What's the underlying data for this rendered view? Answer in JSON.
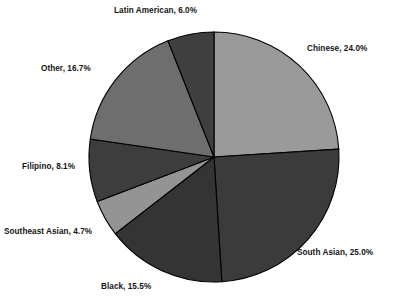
{
  "chart_data": {
    "type": "pie",
    "title": "",
    "subtitle": "",
    "xlabel": "",
    "ylabel": "",
    "legend_position": "none",
    "grid": false,
    "label_format": "{name}, {value}%",
    "start_angle_deg": 0,
    "direction": "clockwise",
    "center": {
      "cx": 214,
      "cy": 157,
      "r": 125
    },
    "categories": [
      "Chinese",
      "South Asian",
      "Black",
      "Southeast Asian",
      "Filipino",
      "Other",
      "Latin American"
    ],
    "values": [
      24.0,
      25.0,
      15.5,
      4.7,
      8.1,
      16.7,
      6.0
    ],
    "slices": [
      {
        "name": "Chinese",
        "value": 24.0,
        "label": "Chinese, 24.0%",
        "color": "#9a9a9a",
        "edge_color": "#000000"
      },
      {
        "name": "South Asian",
        "value": 25.0,
        "label": "South Asian, 25.0%",
        "color": "#3b3b3b",
        "edge_color": "#000000"
      },
      {
        "name": "Black",
        "value": 15.5,
        "label": "Black, 15.5%",
        "color": "#343434",
        "edge_color": "#000000"
      },
      {
        "name": "Southeast Asian",
        "value": 4.7,
        "label": "Southeast Asian, 4.7%",
        "color": "#949494",
        "edge_color": "#000000"
      },
      {
        "name": "Filipino",
        "value": 8.1,
        "label": "Filipino, 8.1%",
        "color": "#3d3d3d",
        "edge_color": "#000000"
      },
      {
        "name": "Other",
        "value": 16.7,
        "label": "Other, 16.7%",
        "color": "#6e6e6e",
        "edge_color": "#000000"
      },
      {
        "name": "Latin American",
        "value": 6.0,
        "label": "Latin American, 6.0%",
        "color": "#3f3f3f",
        "edge_color": "#000000"
      }
    ]
  },
  "figure": {
    "background": "#ffffff",
    "text_color": "#141414"
  }
}
